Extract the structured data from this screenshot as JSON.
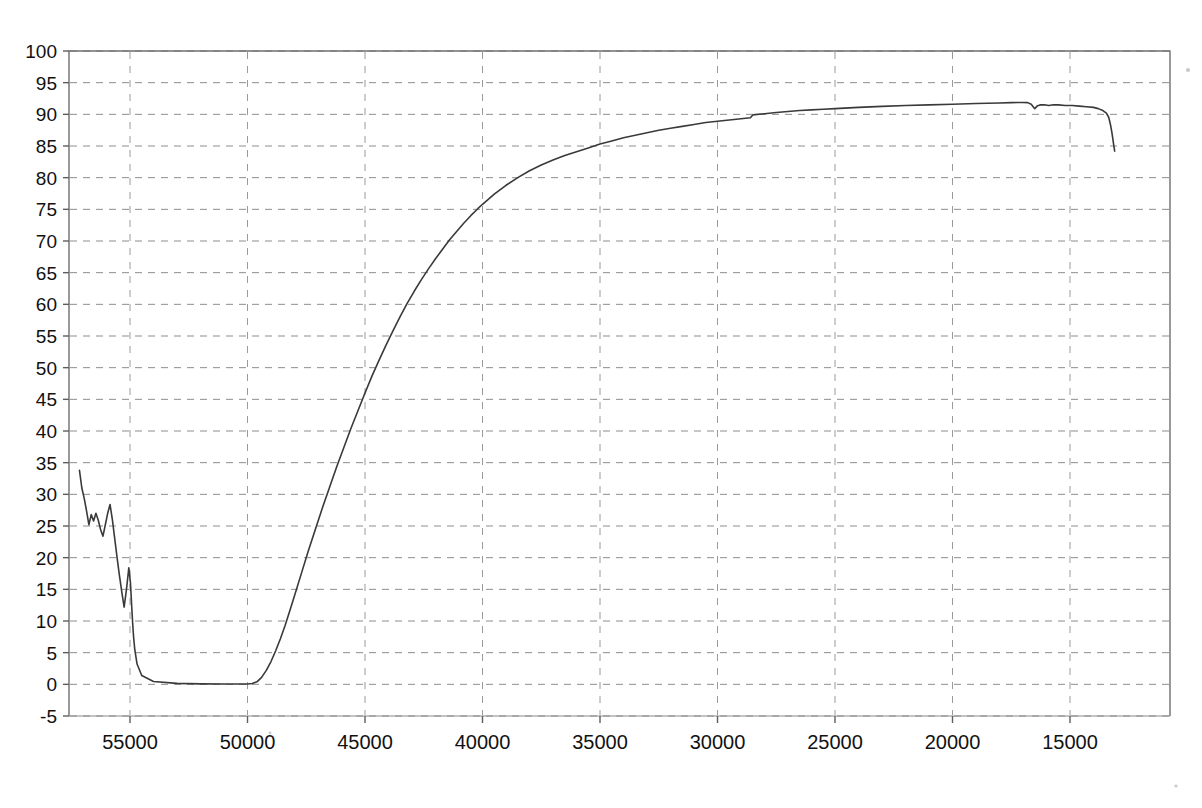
{
  "chart_data": {
    "type": "line",
    "title": "",
    "subtitle": "",
    "xlabel": "",
    "ylabel": "",
    "xlim": [
      57200,
      12500
    ],
    "ylim": [
      -5,
      100
    ],
    "x_reversed": true,
    "grid": true,
    "legend": "none",
    "line_color": "#3a3a3a",
    "xticks": [
      55000,
      50000,
      45000,
      40000,
      35000,
      30000,
      25000,
      20000,
      15000
    ],
    "xtick_labels": [
      "55000",
      "50000",
      "45000",
      "40000",
      "35000",
      "30000",
      "25000",
      "20000",
      "15000"
    ],
    "yticks": [
      -5,
      0,
      5,
      10,
      15,
      20,
      25,
      30,
      35,
      40,
      45,
      50,
      55,
      60,
      65,
      70,
      75,
      80,
      85,
      90,
      95,
      100
    ],
    "ytick_labels": [
      "-5",
      "0",
      "5",
      "10",
      "15",
      "20",
      "25",
      "30",
      "35",
      "40",
      "45",
      "50",
      "55",
      "60",
      "65",
      "70",
      "75",
      "80",
      "85",
      "90",
      "95",
      "100"
    ],
    "series": [
      {
        "name": "transmittance",
        "x": [
          57150,
          57050,
          56950,
          56850,
          56750,
          56650,
          56550,
          56450,
          56350,
          56250,
          56150,
          56050,
          55950,
          55850,
          55750,
          55650,
          55550,
          55450,
          55350,
          55250,
          55150,
          55050,
          54980,
          54930,
          54890,
          54850,
          54800,
          54700,
          54500,
          54000,
          53000,
          52000,
          51000,
          50400,
          50000,
          49800,
          49600,
          49400,
          49200,
          49000,
          48800,
          48600,
          48400,
          48200,
          48000,
          47700,
          47400,
          47100,
          46800,
          46500,
          46200,
          45900,
          45600,
          45300,
          45000,
          44700,
          44400,
          44100,
          43800,
          43500,
          43200,
          42900,
          42600,
          42300,
          42000,
          41700,
          41400,
          41100,
          40800,
          40500,
          40200,
          40000,
          39500,
          39000,
          38500,
          38000,
          37500,
          37000,
          36500,
          36000,
          35500,
          35000,
          34500,
          34000,
          33500,
          33000,
          32500,
          32000,
          31500,
          31000,
          30500,
          30000,
          29500,
          29000,
          28600,
          28500,
          28400,
          28000,
          27500,
          27000,
          26500,
          26000,
          25500,
          25000,
          24000,
          23000,
          22000,
          21000,
          20000,
          19000,
          18500,
          18000,
          17500,
          17200,
          17000,
          16800,
          16650,
          16500,
          16400,
          16250,
          16100,
          15900,
          15700,
          15500,
          15200,
          14900,
          14600,
          14300,
          14000,
          13800,
          13600,
          13450,
          13350,
          13280,
          13220,
          13180,
          13150,
          13120,
          13100
        ],
        "y": [
          33.8,
          31.0,
          29.4,
          27.4,
          25.2,
          26.8,
          25.8,
          27.0,
          25.9,
          24.4,
          23.4,
          25.2,
          27.0,
          28.4,
          26.0,
          23.0,
          20.0,
          17.2,
          14.6,
          12.2,
          15.0,
          18.4,
          16.0,
          12.5,
          9.8,
          7.6,
          5.6,
          3.2,
          1.4,
          0.45,
          0.15,
          0.08,
          0.05,
          0.05,
          0.06,
          0.12,
          0.4,
          1.1,
          2.2,
          3.6,
          5.3,
          7.2,
          9.3,
          11.6,
          14.0,
          17.6,
          21.2,
          24.6,
          28.0,
          31.2,
          34.4,
          37.4,
          40.4,
          43.2,
          46.0,
          48.7,
          51.2,
          53.6,
          55.9,
          58.1,
          60.2,
          62.1,
          63.9,
          65.6,
          67.2,
          68.7,
          70.2,
          71.5,
          72.8,
          74.0,
          75.1,
          75.8,
          77.4,
          78.8,
          80.0,
          81.1,
          82.0,
          82.8,
          83.5,
          84.1,
          84.7,
          85.3,
          85.8,
          86.3,
          86.7,
          87.1,
          87.5,
          87.8,
          88.1,
          88.4,
          88.7,
          88.9,
          89.1,
          89.3,
          89.45,
          89.9,
          89.95,
          90.1,
          90.3,
          90.45,
          90.6,
          90.7,
          90.8,
          90.9,
          91.1,
          91.25,
          91.4,
          91.5,
          91.6,
          91.7,
          91.75,
          91.8,
          91.85,
          91.87,
          91.88,
          91.85,
          91.6,
          90.9,
          91.3,
          91.5,
          91.5,
          91.4,
          91.5,
          91.5,
          91.4,
          91.4,
          91.3,
          91.2,
          91.1,
          90.9,
          90.6,
          90.2,
          89.5,
          88.4,
          87.2,
          86.2,
          85.4,
          84.7,
          84.2
        ]
      }
    ]
  },
  "figure": {
    "background_color": "#ffffff",
    "axis_color": "#6f6f6f",
    "grid_color": "#8d8d8d"
  }
}
